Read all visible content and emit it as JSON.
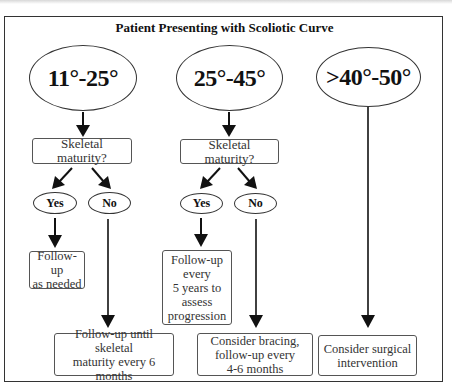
{
  "title": "Patient Presenting with Scoliotic Curve",
  "branches": [
    {
      "range": "11°-25°",
      "question": "Skeletal maturity?",
      "yes_label": "Yes",
      "no_label": "No",
      "yes_outcome": "Follow-up\nas needed",
      "no_outcome": "Follow-up until skeletal\nmaturity every 6 months"
    },
    {
      "range": "25°-45°",
      "question": "Skeletal maturity?",
      "yes_label": "Yes",
      "no_label": "No",
      "yes_outcome": "Follow-up\nevery\n5 years to\nassess\nprogression",
      "no_outcome": "Consider bracing,\nfollow-up every\n4-6 months"
    },
    {
      "range": ">40°-50°",
      "outcome": "Consider surgical\nintervention"
    }
  ],
  "colors": {
    "line": "#111111",
    "border": "#333333",
    "text": "#222222"
  }
}
